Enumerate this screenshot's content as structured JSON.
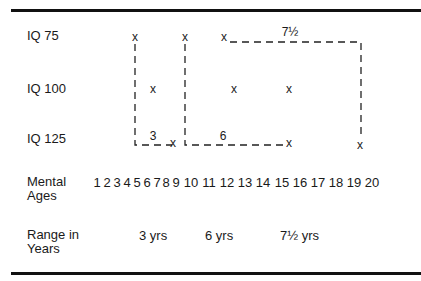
{
  "row_labels": {
    "iq75": "IQ 75",
    "iq100": "IQ 100",
    "iq125": "IQ 125",
    "mental_ages_line1": "Mental",
    "mental_ages_line2": "Ages",
    "range_line1": "Range in",
    "range_line2": "Years"
  },
  "mark_glyph": "x",
  "mental_ages": [
    "1",
    "2",
    "3",
    "4",
    "5",
    "6",
    "7",
    "8",
    "9",
    "10",
    "11",
    "12",
    "13",
    "14",
    "15",
    "16",
    "17",
    "18",
    "19",
    "20"
  ],
  "ranges": {
    "r1": "3 yrs",
    "r2": "6 yrs",
    "r3": "7½ yrs"
  },
  "segment_labels": {
    "s1": "3",
    "s2": "6",
    "s3": "7½"
  },
  "points": [
    {
      "iq": 75,
      "mental_age": 5
    },
    {
      "iq": 75,
      "mental_age": 9
    },
    {
      "iq": 75,
      "mental_age": 12
    },
    {
      "iq": 100,
      "mental_age": 6.5
    },
    {
      "iq": 100,
      "mental_age": 11.5
    },
    {
      "iq": 100,
      "mental_age": 15
    },
    {
      "iq": 125,
      "mental_age": 8.5
    },
    {
      "iq": 125,
      "mental_age": 15
    },
    {
      "iq": 125,
      "mental_age": 19
    }
  ]
}
